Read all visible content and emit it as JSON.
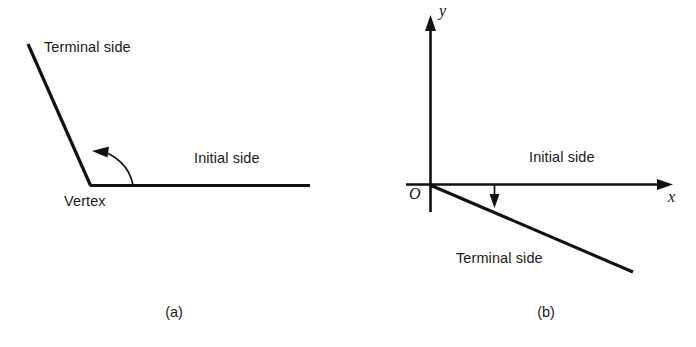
{
  "figure": {
    "background_color": "#ffffff",
    "ink_color": "#111111",
    "panels": [
      {
        "id": "a",
        "caption": "(a)",
        "labels": {
          "terminal_side": "Terminal side",
          "initial_side": "Initial side",
          "vertex": "Vertex"
        },
        "geometry": {
          "vertex": [
            90,
            185
          ],
          "terminal_side_end": [
            28,
            44
          ],
          "initial_side_end": [
            310,
            185
          ],
          "arc_start": [
            133,
            185
          ],
          "arc_end": [
            95,
            152
          ],
          "arc_direction": "counterclockwise",
          "arrow_at": "terminal-side"
        }
      },
      {
        "id": "b",
        "caption": "(b)",
        "labels": {
          "initial_side": "Initial side",
          "terminal_side": "Terminal side",
          "origin": "O",
          "y_axis": "y",
          "x_axis": "x"
        },
        "geometry": {
          "origin": [
            82,
            185
          ],
          "y_axis_top": [
            82,
            17
          ],
          "y_axis_bottom": [
            82,
            212
          ],
          "x_axis_left": [
            58,
            185
          ],
          "x_axis_right": [
            324,
            184
          ],
          "terminal_side_end": [
            285,
            272
          ],
          "rotation_arrow_x": 146,
          "rotation_arrow_from_y": 185,
          "rotation_arrow_to_y": 207,
          "rotation_direction": "clockwise",
          "arrow_at": "x-axis-to-terminal-side"
        }
      }
    ]
  }
}
